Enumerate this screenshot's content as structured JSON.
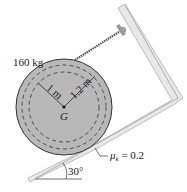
{
  "figure": {
    "mass_label": "160 kg",
    "inner_radius_label": "1 m",
    "outer_radius_label": "1.2 m",
    "center_label": "G",
    "friction_symbol": "μ",
    "friction_subscript": "k",
    "friction_value": " = 0.2",
    "angle_label": "30°"
  },
  "colors": {
    "disk_fill": "#b8b8b8",
    "surface_fill": "#e6e6e6",
    "stroke": "#333333"
  }
}
